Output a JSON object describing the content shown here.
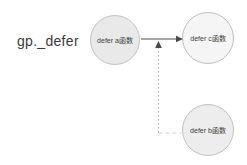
{
  "diagram": {
    "background": "#ffffff",
    "root_label": "gp._defer",
    "root_label_color": "#3a3a3a",
    "nodes": [
      {
        "id": "defer-a",
        "label": "defer a函数",
        "fill": "#e9e9e9",
        "border": "#c2c2c2"
      },
      {
        "id": "defer-c",
        "label": "defer c函数",
        "fill": "#f5f5f5",
        "border": "#bfbfbf"
      },
      {
        "id": "defer-b",
        "label": "defer b函数",
        "fill": "#ededed",
        "border": "#c2c2c2"
      }
    ],
    "edges": [
      {
        "from": "defer-a",
        "to": "defer-c",
        "line": "solid",
        "color": "#4a4a4a"
      },
      {
        "from": "defer-b",
        "to": "link between defer-a and defer-c",
        "line": "dotted",
        "color": "#a8a8a8",
        "color_horizontal": "#cfcfcf"
      }
    ],
    "arrowhead_color": "#4a4a4a"
  }
}
